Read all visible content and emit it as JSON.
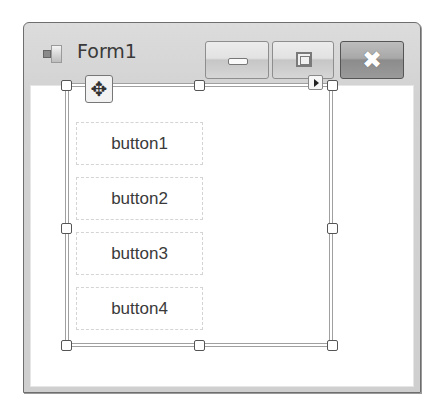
{
  "window": {
    "title": "Form1",
    "caption_buttons": {
      "minimize_icon": "minimize-icon",
      "maximize_icon": "maximize-icon",
      "close_icon": "close-icon",
      "close_glyph": "✖"
    }
  },
  "designer": {
    "move_glyph": "✥",
    "buttons": [
      {
        "label": "button1"
      },
      {
        "label": "button2"
      },
      {
        "label": "button3"
      },
      {
        "label": "button4"
      }
    ]
  }
}
